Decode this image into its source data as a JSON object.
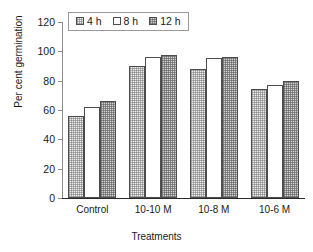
{
  "chart_data": {
    "type": "bar",
    "title": "",
    "xlabel": "Treatments",
    "ylabel": "Per cent germination",
    "categories": [
      "Control",
      "10-10 M",
      "10-8 M",
      "10-6 M"
    ],
    "series": [
      {
        "name": "4 h",
        "values": [
          56,
          90,
          88,
          74
        ]
      },
      {
        "name": "8 h",
        "values": [
          62,
          96,
          95.5,
          77
        ]
      },
      {
        "name": "12 h",
        "values": [
          66,
          97.5,
          96,
          80
        ]
      }
    ],
    "ylim": [
      0,
      120
    ],
    "yticks": [
      0,
      20,
      40,
      60,
      80,
      100,
      120
    ],
    "ytick_labels": [
      "0",
      "20",
      "40",
      "60",
      "80",
      "100",
      "120"
    ],
    "grid": false,
    "legend_position": "top-left-inside",
    "legend_entries": [
      "4 h",
      "8 h",
      "12 h"
    ],
    "colors": {
      "series_4h": "#eeeeee",
      "series_8h": "#ffffff",
      "series_12h": "#d2d2d2",
      "bar_outline": "#4d4d4d",
      "axis": "#2b2b2b",
      "text": "#1a1a1a",
      "background": "#ffffff"
    }
  }
}
